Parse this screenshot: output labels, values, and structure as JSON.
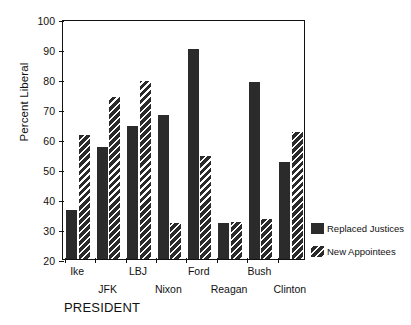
{
  "chart_data": {
    "type": "bar",
    "title": "",
    "xlabel": "PRESIDENT",
    "ylabel": "Percent Liberal",
    "ylim": [
      20,
      100
    ],
    "ytick_step": 10,
    "yticks": [
      20,
      30,
      40,
      50,
      60,
      70,
      80,
      90,
      100
    ],
    "grid": false,
    "legend_position": "right",
    "categories": [
      "Ike",
      "JFK",
      "LBJ",
      "Nixon",
      "Ford",
      "Reagan",
      "Bush",
      "Clinton"
    ],
    "series": [
      {
        "name": "Replaced Justices",
        "fill": "solid",
        "color": "#2b2b2b",
        "values": [
          36.5,
          57.5,
          64.5,
          68,
          90,
          32,
          79,
          52.5
        ]
      },
      {
        "name": "New Appointees",
        "fill": "hatched",
        "color": "#2b2b2b",
        "values": [
          61.5,
          74,
          79.5,
          32,
          54.5,
          32.5,
          33.5,
          62.5
        ]
      }
    ]
  },
  "legend": {
    "items": [
      {
        "label": "Replaced Justices",
        "fill": "solid"
      },
      {
        "label": "New Appointees",
        "fill": "hatched"
      }
    ]
  },
  "axes": {
    "y_title": "Percent Liberal",
    "x_title": "PRESIDENT"
  }
}
